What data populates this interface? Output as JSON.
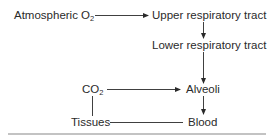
{
  "diagram": {
    "nodes": {
      "atmospheric_o2": {
        "label": "Atmospheric O",
        "sub": "2"
      },
      "upper_tract": {
        "label": "Upper respiratory tract"
      },
      "lower_tract": {
        "label": "Lower respiratory tract"
      },
      "co2": {
        "label": "CO",
        "sub": "2"
      },
      "alveoli": {
        "label": "Alveoli"
      },
      "tissues": {
        "label": "Tissues"
      },
      "blood": {
        "label": "Blood"
      }
    },
    "edges": [
      {
        "from": "Atmospheric O2",
        "to": "Upper respiratory tract",
        "type": "arrow"
      },
      {
        "from": "Upper respiratory tract",
        "to": "Lower respiratory tract",
        "type": "arrow"
      },
      {
        "from": "Lower respiratory tract",
        "to": "Alveoli",
        "type": "arrow"
      },
      {
        "from": "CO2",
        "to": "Alveoli",
        "type": "arrow"
      },
      {
        "from": "Alveoli",
        "to": "Blood",
        "type": "arrow"
      },
      {
        "from": "Blood",
        "to": "Tissues",
        "type": "line"
      },
      {
        "from": "Tissues",
        "to": "CO2",
        "type": "line"
      }
    ],
    "colors": {
      "line": "#2a2a2a",
      "rule": "#888888",
      "background": "#ffffff"
    }
  }
}
